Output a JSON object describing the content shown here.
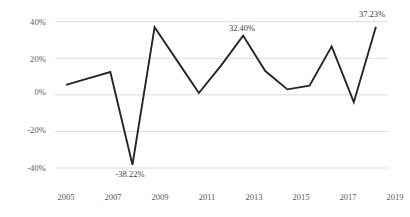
{
  "chart_data": {
    "type": "line",
    "title": "",
    "subtitle": "",
    "xlabel": "",
    "ylabel": "",
    "grid": "horizontal",
    "legend": "none",
    "x": [
      2005,
      2006,
      2007,
      2008,
      2009,
      2010,
      2011,
      2012,
      2013,
      2014,
      2015,
      2016,
      2017,
      2018,
      2019
    ],
    "categories": [
      "2005",
      "2006",
      "2007",
      "2008",
      "2009",
      "2010",
      "2011",
      "2012",
      "2013",
      "2014",
      "2015",
      "2016",
      "2017",
      "2018",
      "2019"
    ],
    "values": [
      5.5,
      9.0,
      12.5,
      -38.22,
      37.0,
      19.0,
      1.0,
      16.0,
      32.4,
      13.0,
      3.0,
      5.0,
      26.5,
      -4.0,
      37.23
    ],
    "ylim": [
      -40,
      40
    ],
    "yticks": [
      40,
      20,
      0,
      -20,
      -40
    ],
    "ytick_labels": [
      "40%",
      "20%",
      "0%",
      "-20%",
      "-40%"
    ],
    "xtick_values": [
      2005,
      2007,
      2009,
      2011,
      2013,
      2015,
      2017,
      2019
    ],
    "xtick_labels": [
      "2005",
      "2007",
      "2009",
      "2011",
      "2013",
      "2015",
      "2017",
      "2019"
    ],
    "line_color": "#262626",
    "grid_color": "#d9d9d9",
    "annotations": [
      {
        "label": "-38.22%",
        "x": 2008,
        "y": -38.22,
        "position": "below"
      },
      {
        "label": "32.40%",
        "x": 2013,
        "y": 32.4,
        "position": "above"
      },
      {
        "label": "37.23%",
        "x": 2019,
        "y": 37.23,
        "position": "above"
      }
    ]
  },
  "axis": {
    "y_labels": [
      "40%",
      "20%",
      "0%",
      "-20%",
      "-40%"
    ],
    "x_labels": [
      "2005",
      "2007",
      "2009",
      "2011",
      "2013",
      "2015",
      "2017",
      "2019"
    ]
  },
  "labels": {
    "low_2008": "-38.22%",
    "peak_2013": "32.40%",
    "peak_2019": "37.23%"
  }
}
